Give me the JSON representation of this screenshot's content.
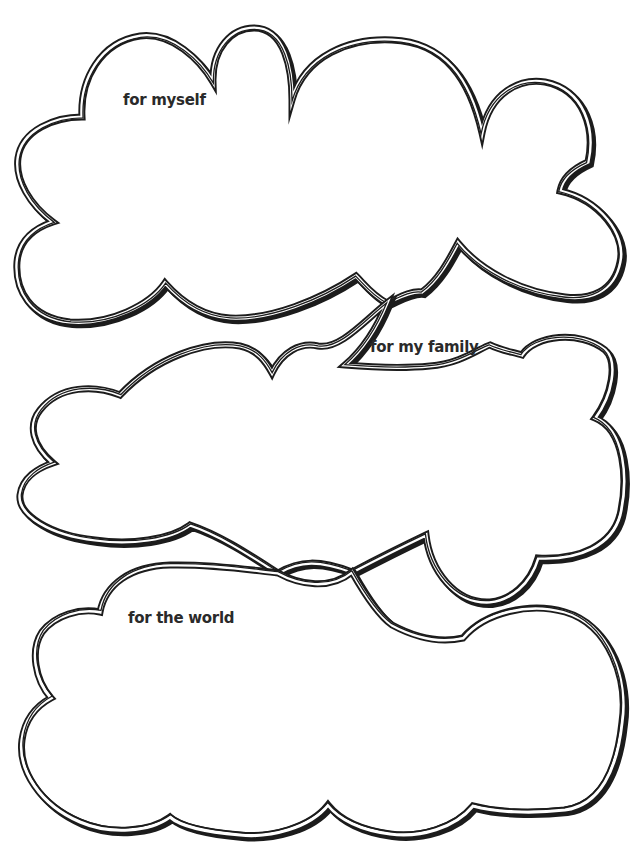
{
  "worksheet": {
    "clouds": [
      {
        "id": "myself",
        "label": "for myself"
      },
      {
        "id": "family",
        "label": "for my family"
      },
      {
        "id": "world",
        "label": "for the world"
      }
    ]
  },
  "colors": {
    "ink": "#1c1c1c",
    "paper": "#ffffff",
    "text": "#2a2a2a"
  }
}
